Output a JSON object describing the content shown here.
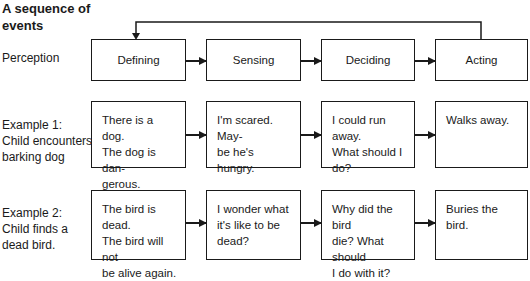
{
  "title": "A sequence of events",
  "stages": [
    "Defining",
    "Sensing",
    "Deciding",
    "Acting"
  ],
  "rows": [
    {
      "label": "Perception",
      "cells": [
        "Defining",
        "Sensing",
        "Deciding",
        "Acting"
      ]
    },
    {
      "label": "Example 1: Child encounters barking dog",
      "label_lines": [
        "Example 1:",
        "Child encounters",
        "barking dog"
      ],
      "cells": [
        "There is a dog. The dog is dangerous.",
        "I'm scared. Maybe he's hungry.",
        "I could run away. What should I do?",
        "Walks away."
      ],
      "cell_lines": [
        [
          "There is a dog.",
          "The dog is dan-",
          "gerous."
        ],
        [
          "I'm scared. May-",
          "be he's hungry."
        ],
        [
          "I could run away.",
          "What should I",
          "do?"
        ],
        [
          "Walks away."
        ]
      ]
    },
    {
      "label": "Example 2: Child finds a dead bird.",
      "label_lines": [
        "Example 2:",
        "Child finds a",
        "dead bird."
      ],
      "cells": [
        "The bird is dead. The bird will not be alive again.",
        "I wonder what it's like to be dead?",
        "Why did the bird die? What should I do with it?",
        "Buries the bird."
      ],
      "cell_lines": [
        [
          "The bird is dead.",
          "The bird will not",
          "be alive again."
        ],
        [
          "I wonder what",
          "it's like to be",
          "dead?"
        ],
        [
          "Why did the bird",
          "die? What should",
          "I do with it?"
        ],
        [
          "Buries the bird."
        ]
      ]
    }
  ],
  "feedback_arrow": {
    "from": "Acting",
    "to": "Defining"
  }
}
